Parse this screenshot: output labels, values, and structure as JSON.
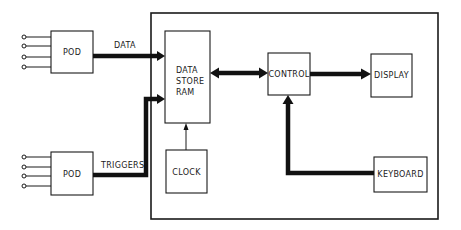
{
  "diagram": {
    "type": "block-diagram",
    "colors": {
      "line": "#111111",
      "background": "#ffffff"
    },
    "blocks": {
      "pod_data": {
        "label": "POD"
      },
      "pod_triggers": {
        "label": "POD"
      },
      "data_store": {
        "lines": [
          "DATA",
          "STORE",
          "RAM"
        ]
      },
      "clock": {
        "label": "CLOCK"
      },
      "control": {
        "label": "CONTROL"
      },
      "display": {
        "label": "DISPLAY"
      },
      "keyboard": {
        "label": "KEYBOARD"
      }
    },
    "connections": {
      "data": {
        "label": "DATA",
        "from": "POD",
        "to": "DATA STORE RAM"
      },
      "triggers": {
        "label": "TRIGGERS",
        "from": "POD",
        "to": "DATA STORE RAM"
      },
      "store_control": {
        "from": "CONTROL",
        "to": "DATA STORE RAM",
        "bidirectional": true
      },
      "control_display": {
        "from": "CONTROL",
        "to": "DISPLAY"
      },
      "keyboard_control": {
        "from": "KEYBOARD",
        "to": "CONTROL"
      },
      "clock_store": {
        "from": "CLOCK",
        "to": "DATA STORE RAM"
      }
    },
    "pod_inputs_per_pod": 4
  }
}
